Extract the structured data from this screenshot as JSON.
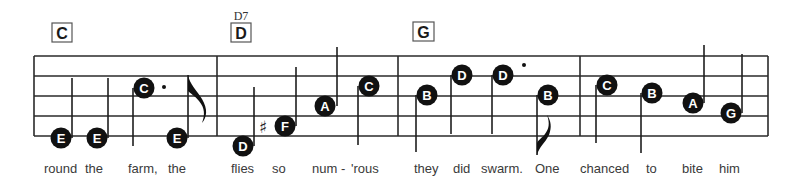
{
  "staff": {
    "left": 34,
    "right": 768,
    "lines_y": [
      56,
      76,
      96,
      116,
      136
    ],
    "barlines_x": [
      217,
      398,
      580
    ]
  },
  "chords": [
    {
      "label": "C",
      "x": 52,
      "y": 23,
      "w": 20,
      "h": 19,
      "superscript": ""
    },
    {
      "label": "D",
      "x": 231,
      "y": 23,
      "w": 20,
      "h": 19,
      "superscript": "D7"
    },
    {
      "label": "G",
      "x": 413,
      "y": 22,
      "w": 21,
      "h": 19,
      "superscript": ""
    }
  ],
  "measures": [
    {
      "chord": "C",
      "notes": [
        {
          "name": "E",
          "x": 61,
          "y": 138,
          "stem": "up",
          "stem_x": 72,
          "stem_end": 78
        },
        {
          "name": "E",
          "x": 97,
          "y": 138,
          "stem": "up",
          "stem_x": 108,
          "stem_end": 78
        },
        {
          "name": "C",
          "x": 144,
          "y": 88,
          "stem": "down",
          "stem_x": 133,
          "stem_end": 146,
          "dotted": true,
          "dot_x": 164,
          "dot_y": 87
        },
        {
          "name": "E",
          "x": 177,
          "y": 138,
          "stem": "up",
          "stem_x": 188,
          "stem_end": 75,
          "flag": "up"
        }
      ]
    },
    {
      "chord": "D",
      "chord_superscript": "D7",
      "notes": [
        {
          "name": "D",
          "x": 243,
          "y": 146,
          "stem": "up",
          "stem_x": 254,
          "stem_end": 87
        },
        {
          "name": "F",
          "x": 285,
          "y": 126,
          "stem": "up",
          "stem_x": 296,
          "stem_end": 67,
          "accidental": "♯",
          "acc_x": 263,
          "acc_y": 133
        },
        {
          "name": "A",
          "x": 325,
          "y": 106,
          "stem": "up",
          "stem_x": 337,
          "stem_end": 47
        },
        {
          "name": "C",
          "x": 369,
          "y": 86,
          "stem": "down",
          "stem_x": 358,
          "stem_end": 145
        }
      ]
    },
    {
      "chord": "G",
      "notes": [
        {
          "name": "B",
          "x": 427,
          "y": 95,
          "stem": "down",
          "stem_x": 416,
          "stem_end": 152
        },
        {
          "name": "D",
          "x": 462,
          "y": 75,
          "stem": "down",
          "stem_x": 451,
          "stem_end": 134
        },
        {
          "name": "D",
          "x": 503,
          "y": 75,
          "stem": "down",
          "stem_x": 492,
          "stem_end": 134,
          "dotted": true,
          "dot_x": 524,
          "dot_y": 65
        },
        {
          "name": "B",
          "x": 548,
          "y": 95,
          "stem": "down",
          "stem_x": 537,
          "stem_end": 155,
          "flag": "down"
        }
      ]
    },
    {
      "chord": "",
      "notes": [
        {
          "name": "C",
          "x": 607,
          "y": 85,
          "stem": "down",
          "stem_x": 596,
          "stem_end": 143
        },
        {
          "name": "B",
          "x": 652,
          "y": 93,
          "stem": "down",
          "stem_x": 641,
          "stem_end": 153
        },
        {
          "name": "A",
          "x": 693,
          "y": 103,
          "stem": "up",
          "stem_x": 704,
          "stem_end": 45
        },
        {
          "name": "G",
          "x": 731,
          "y": 113,
          "stem": "up",
          "stem_x": 742,
          "stem_end": 54
        }
      ]
    }
  ],
  "lyrics": [
    {
      "text": "round",
      "x": 44
    },
    {
      "text": "the",
      "x": 85
    },
    {
      "text": "farm,",
      "x": 128
    },
    {
      "text": "the",
      "x": 168
    },
    {
      "text": "flies",
      "x": 231
    },
    {
      "text": "so",
      "x": 272
    },
    {
      "text": "num -",
      "x": 312
    },
    {
      "text": "'rous",
      "x": 351
    },
    {
      "text": "they",
      "x": 414
    },
    {
      "text": "did",
      "x": 453
    },
    {
      "text": "swarm.",
      "x": 481
    },
    {
      "text": "One",
      "x": 535
    },
    {
      "text": "chanced",
      "x": 580
    },
    {
      "text": "to",
      "x": 646
    },
    {
      "text": "bite",
      "x": 682
    },
    {
      "text": "him",
      "x": 719
    }
  ],
  "lyrics_baseline_y": 173,
  "colors": {
    "notehead": "#111111",
    "note_letter": "#ffffff",
    "staff": "#2a2a2a",
    "lyric": "#3a3a3a",
    "background": "#ffffff"
  }
}
